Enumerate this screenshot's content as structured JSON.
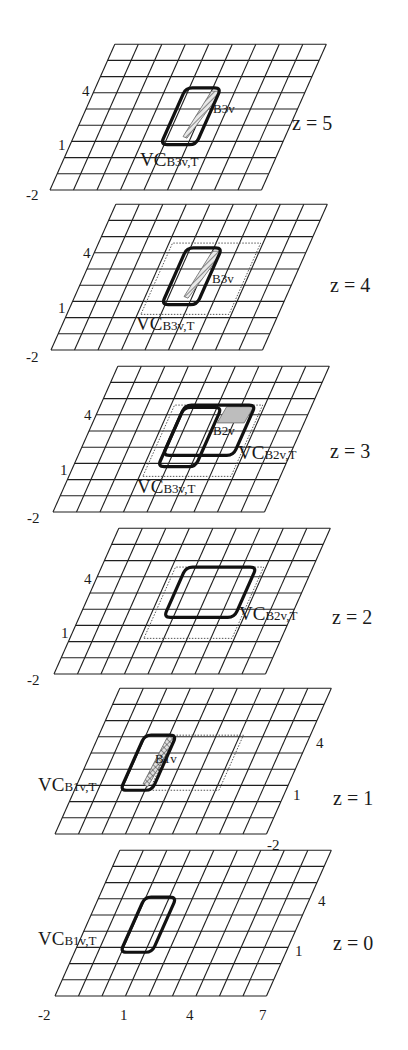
{
  "figure": {
    "grid": {
      "x_min": -2,
      "x_max": 7,
      "y_min": -2,
      "y_max": 7
    },
    "transform": {
      "x_step": 23.5,
      "shear": 7.2,
      "y_step": 16.2
    },
    "layers": [
      {
        "z_label": "z = 5",
        "origin": [
          50,
          190
        ],
        "z_label_pos": [
          292,
          130
        ],
        "axis_labels": [
          {
            "text": "4",
            "pos": [
              82,
              96
            ]
          },
          {
            "text": "1",
            "pos": [
              58,
              150
            ]
          },
          {
            "text": "-2",
            "pos": [
              26,
              200
            ]
          }
        ],
        "dotted": null,
        "shapes": [
          {
            "name": "VC_B3v_T",
            "rect": [
              1.85,
              0.8,
              3.35,
              4.3
            ],
            "fill": "none"
          }
        ],
        "regions": [
          {
            "name": "B3v",
            "poly": [
              [
                3.0,
                4.1
              ],
              [
                3.35,
                4.1
              ],
              [
                3.3,
                3.4
              ],
              [
                2.85,
                1.2
              ],
              [
                2.65,
                1.3
              ]
            ],
            "style": "hatch"
          }
        ],
        "labels": [
          {
            "main": "VC",
            "sub": "B3v,T",
            "pos": [
              140,
              166
            ]
          },
          {
            "main": "",
            "sub": "B3v",
            "pos": [
              213,
              113
            ]
          }
        ]
      },
      {
        "z_label": "z = 4",
        "origin": [
          51,
          350
        ],
        "z_label_pos": [
          330,
          292
        ],
        "axis_labels": [
          {
            "text": "4",
            "pos": [
              83,
              258
            ]
          },
          {
            "text": "1",
            "pos": [
              58,
              313
            ]
          },
          {
            "text": "-2",
            "pos": [
              26,
              362
            ]
          }
        ],
        "dotted": [
          1.15,
          0.2,
          4.9,
          4.6
        ],
        "shapes": [
          {
            "name": "VC_B3v_T",
            "rect": [
              1.85,
              0.8,
              3.35,
              4.3
            ],
            "fill": "none"
          }
        ],
        "regions": [
          {
            "name": "B3v",
            "poly": [
              [
                3.0,
                4.1
              ],
              [
                3.35,
                4.1
              ],
              [
                3.3,
                3.4
              ],
              [
                2.85,
                1.2
              ],
              [
                2.65,
                1.3
              ]
            ],
            "style": "hatch"
          }
        ],
        "labels": [
          {
            "main": "VC",
            "sub": "B3v,T",
            "pos": [
              136,
              330
            ]
          },
          {
            "main": "",
            "sub": "B3v",
            "pos": [
              212,
              283
            ]
          }
        ]
      },
      {
        "z_label": "z = 3",
        "origin": [
          53,
          512
        ],
        "z_label_pos": [
          330,
          458
        ],
        "axis_labels": [
          {
            "text": "4",
            "pos": [
              84,
              420
            ]
          },
          {
            "text": "1",
            "pos": [
              60,
              475
            ]
          },
          {
            "text": "-2",
            "pos": [
              27,
              523
            ]
          }
        ],
        "dotted": [
          1.15,
          0.2,
          4.9,
          4.6
        ],
        "shapes": [
          {
            "name": "VC_B3v_T",
            "rect": [
              1.6,
              0.8,
              3.2,
              4.45
            ],
            "fill": "none"
          },
          {
            "name": "VC_B2v_T",
            "rect": [
              1.6,
              1.5,
              4.6,
              4.6
            ],
            "fill": "none"
          }
        ],
        "regions": [
          {
            "name": "B2v",
            "poly": [
              [
                3.3,
                3.5
              ],
              [
                4.45,
                3.5
              ],
              [
                4.55,
                4.5
              ],
              [
                3.4,
                4.5
              ]
            ],
            "style": "gray"
          }
        ],
        "labels": [
          {
            "main": "VC",
            "sub": "B3v,T",
            "pos": [
              137,
              493
            ]
          },
          {
            "main": "",
            "sub": "B2v",
            "pos": [
              213,
              435
            ]
          },
          {
            "main": "VC",
            "sub": "B2v,T",
            "pos": [
              238,
              459
            ]
          }
        ]
      },
      {
        "z_label": "z = 2",
        "origin": [
          54,
          674
        ],
        "z_label_pos": [
          332,
          624
        ],
        "axis_labels": [
          {
            "text": "4",
            "pos": [
              84,
              584
            ]
          },
          {
            "text": "1",
            "pos": [
              61,
              638
            ]
          },
          {
            "text": "-2",
            "pos": [
              27,
              685
            ]
          }
        ],
        "dotted": [
          1.15,
          0.2,
          4.9,
          4.6
        ],
        "shapes": [
          {
            "name": "VC_B2v_T",
            "rect": [
              1.6,
              1.5,
              4.6,
              4.6
            ],
            "fill": "none"
          }
        ],
        "regions": [],
        "labels": [
          {
            "main": "VC",
            "sub": "B2v,T",
            "pos": [
              239,
              620
            ]
          }
        ]
      },
      {
        "z_label": "z = 1",
        "origin": [
          55,
          834
        ],
        "z_label_pos": [
          333,
          805
        ],
        "axis_labels": [
          {
            "text": "4",
            "pos": [
              316,
              748
            ]
          },
          {
            "text": "1",
            "pos": [
              293,
              800
            ]
          },
          {
            "text": "-2",
            "pos": [
              267,
              850
            ]
          }
        ],
        "dotted": [
          1.2,
          0.7,
          4.15,
          4.1
        ],
        "shapes": [
          {
            "name": "VC_B1v_T",
            "rect": [
              -0.05,
              0.7,
              1.3,
              4.1
            ],
            "fill": "none"
          }
        ],
        "regions": [
          {
            "name": "B1v",
            "poly": [
              [
                0.95,
                4.0
              ],
              [
                1.3,
                4.0
              ],
              [
                1.25,
                3.2
              ],
              [
                1.05,
                0.9
              ],
              [
                0.8,
                1.1
              ]
            ],
            "style": "crosshatch"
          }
        ],
        "labels": [
          {
            "main": "VC",
            "sub": "B1v,T",
            "pos": [
              38,
              791
            ]
          },
          {
            "main": "",
            "sub": "B1v",
            "pos": [
              155,
              763
            ]
          }
        ]
      },
      {
        "z_label": "z = 0",
        "origin": [
          55,
          996
        ],
        "z_label_pos": [
          333,
          950
        ],
        "axis_labels": [
          {
            "text": "4",
            "pos": [
              318,
              906
            ]
          },
          {
            "text": "1",
            "pos": [
              295,
              956
            ]
          },
          {
            "text": "-2",
            "pos": [
              38,
              1020
            ]
          },
          {
            "text": "1",
            "pos": [
              120,
              1020
            ]
          },
          {
            "text": "4",
            "pos": [
              186,
              1020
            ]
          },
          {
            "text": "7",
            "pos": [
              259,
              1020
            ]
          }
        ],
        "dotted": null,
        "shapes": [
          {
            "name": "VC_B1v_T",
            "rect": [
              -0.05,
              0.7,
              1.3,
              4.1
            ],
            "fill": "none"
          }
        ],
        "regions": [],
        "labels": [
          {
            "main": "VC",
            "sub": "B1v,T",
            "pos": [
              38,
              945
            ]
          }
        ]
      }
    ]
  }
}
